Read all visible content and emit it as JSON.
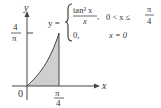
{
  "diagram": {
    "axes": {
      "x_label": "x",
      "y_label": "y",
      "origin_label": "0",
      "x_tick": {
        "num": "π",
        "den": "4"
      },
      "y_tick": {
        "num": "4",
        "den": "π"
      }
    },
    "equation": {
      "lhs": "y =",
      "case1_num": "tan² x",
      "case1_den": "x",
      "case1_comma": ",",
      "case1_condition": "0 < x ≤",
      "case1_cond_num": "π",
      "case1_cond_den": "4",
      "case2_value": "0,",
      "case2_condition": "x = 0"
    },
    "colors": {
      "shade": "#cfcfcf",
      "stroke": "#444444"
    }
  }
}
